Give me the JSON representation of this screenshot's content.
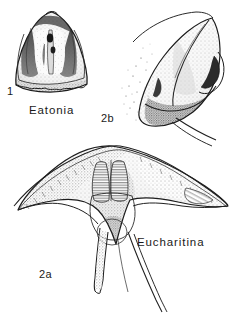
{
  "plate": {
    "background_color": "#ffffff",
    "ink_color": "#1a1a1a",
    "medium": "stippled pen-and-ink scientific illustration",
    "figures": [
      {
        "id": "figure-1",
        "number": "1",
        "taxon_label": "Eatonia",
        "description": "ventral interior of brachiopod valve, sub-triangular outline, dark shaded muscle field with median ridge, crenulate anterior margin"
      },
      {
        "id": "figure-2b",
        "number": "2b",
        "taxon_label": "",
        "description": "oblique lateral view of alate brachiopod valve with stippled shading and two thin trailing spines"
      },
      {
        "id": "figure-2a",
        "number": "2a",
        "taxon_label": "Eucharitina",
        "description": "ventral view of winged brachiopod, broad alate hinge line, paired striated muscle scars, three long tapering spines"
      }
    ]
  },
  "labels": {
    "figure_1_number": "1",
    "figure_1_name": "Eatonia",
    "figure_2b_number": "2b",
    "figure_2a_number": "2a",
    "figure_2a_name": "Eucharitina"
  }
}
